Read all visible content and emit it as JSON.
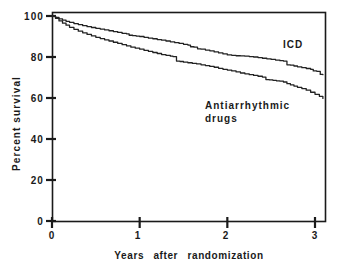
{
  "chart_data": {
    "type": "line",
    "title": "",
    "subtitle": "",
    "xlabel": "Years  after  randomization",
    "ylabel": "Percent  survival",
    "xlim": [
      0,
      3.1
    ],
    "ylim": [
      0,
      100
    ],
    "xticks": [
      0,
      1,
      2,
      3
    ],
    "xtick_labels": [
      "0",
      "1",
      "2",
      "3"
    ],
    "yticks": [
      0,
      20,
      40,
      60,
      80,
      100
    ],
    "ytick_labels": [
      "0",
      "20",
      "40",
      "60",
      "80",
      "100"
    ],
    "grid": false,
    "legend_position": "inline-annotations",
    "annotations": [
      {
        "text": "ICD",
        "x": 2.65,
        "y": 82
      },
      {
        "text": "Antiarrhythmic",
        "x": 1.75,
        "y": 57
      },
      {
        "text": "drugs",
        "x": 1.75,
        "y": 51
      }
    ],
    "series": [
      {
        "name": "ICD",
        "label": "ICD",
        "style": "step",
        "color": "#222222",
        "points": [
          [
            0.0,
            100.0
          ],
          [
            0.04,
            99.3
          ],
          [
            0.08,
            98.6
          ],
          [
            0.12,
            98.0
          ],
          [
            0.16,
            97.4
          ],
          [
            0.2,
            96.9
          ],
          [
            0.25,
            96.3
          ],
          [
            0.3,
            95.8
          ],
          [
            0.35,
            95.3
          ],
          [
            0.4,
            94.8
          ],
          [
            0.45,
            94.4
          ],
          [
            0.5,
            94.0
          ],
          [
            0.55,
            93.6
          ],
          [
            0.6,
            93.2
          ],
          [
            0.65,
            92.8
          ],
          [
            0.7,
            92.4
          ],
          [
            0.75,
            92.0
          ],
          [
            0.8,
            91.5
          ],
          [
            0.85,
            91.3
          ],
          [
            0.88,
            90.6
          ],
          [
            0.92,
            90.4
          ],
          [
            0.96,
            90.2
          ],
          [
            1.0,
            90.0
          ],
          [
            1.05,
            89.6
          ],
          [
            1.1,
            89.2
          ],
          [
            1.15,
            88.9
          ],
          [
            1.2,
            88.5
          ],
          [
            1.25,
            88.2
          ],
          [
            1.3,
            87.8
          ],
          [
            1.35,
            87.4
          ],
          [
            1.4,
            87.0
          ],
          [
            1.45,
            86.6
          ],
          [
            1.5,
            86.2
          ],
          [
            1.55,
            85.8
          ],
          [
            1.58,
            85.0
          ],
          [
            1.62,
            84.8
          ],
          [
            1.66,
            84.0
          ],
          [
            1.7,
            83.8
          ],
          [
            1.75,
            83.4
          ],
          [
            1.8,
            83.0
          ],
          [
            1.85,
            82.5
          ],
          [
            1.9,
            82.0
          ],
          [
            1.95,
            81.5
          ],
          [
            2.0,
            81.0
          ],
          [
            2.05,
            80.8
          ],
          [
            2.1,
            80.6
          ],
          [
            2.15,
            80.5
          ],
          [
            2.2,
            80.4
          ],
          [
            2.25,
            80.2
          ],
          [
            2.3,
            80.0
          ],
          [
            2.35,
            79.7
          ],
          [
            2.4,
            79.4
          ],
          [
            2.45,
            79.1
          ],
          [
            2.5,
            78.8
          ],
          [
            2.55,
            78.5
          ],
          [
            2.6,
            78.2
          ],
          [
            2.64,
            78.0
          ],
          [
            2.68,
            76.2
          ],
          [
            2.72,
            76.0
          ],
          [
            2.76,
            75.6
          ],
          [
            2.8,
            75.2
          ],
          [
            2.85,
            74.8
          ],
          [
            2.9,
            74.4
          ],
          [
            2.95,
            74.0
          ],
          [
            2.98,
            73.2
          ],
          [
            3.02,
            73.0
          ],
          [
            3.05,
            73.0
          ],
          [
            3.06,
            71.5
          ],
          [
            3.09,
            71.4
          ]
        ]
      },
      {
        "name": "Antiarrhythmic drugs",
        "label": "Antiarrhythmic drugs",
        "style": "step",
        "color": "#222222",
        "points": [
          [
            0.0,
            100.0
          ],
          [
            0.04,
            98.8
          ],
          [
            0.08,
            97.6
          ],
          [
            0.12,
            96.5
          ],
          [
            0.16,
            95.5
          ],
          [
            0.2,
            94.5
          ],
          [
            0.25,
            93.5
          ],
          [
            0.3,
            92.6
          ],
          [
            0.35,
            91.8
          ],
          [
            0.4,
            91.0
          ],
          [
            0.45,
            90.3
          ],
          [
            0.5,
            89.6
          ],
          [
            0.55,
            89.0
          ],
          [
            0.6,
            88.4
          ],
          [
            0.65,
            87.8
          ],
          [
            0.7,
            87.2
          ],
          [
            0.75,
            86.6
          ],
          [
            0.8,
            86.0
          ],
          [
            0.85,
            85.4
          ],
          [
            0.9,
            84.8
          ],
          [
            0.95,
            84.3
          ],
          [
            1.0,
            83.8
          ],
          [
            1.05,
            83.2
          ],
          [
            1.1,
            82.7
          ],
          [
            1.15,
            82.2
          ],
          [
            1.2,
            81.7
          ],
          [
            1.25,
            81.2
          ],
          [
            1.3,
            80.8
          ],
          [
            1.35,
            80.4
          ],
          [
            1.38,
            80.2
          ],
          [
            1.42,
            78.0
          ],
          [
            1.46,
            77.8
          ],
          [
            1.5,
            77.5
          ],
          [
            1.55,
            77.2
          ],
          [
            1.6,
            76.9
          ],
          [
            1.65,
            76.6
          ],
          [
            1.7,
            76.2
          ],
          [
            1.75,
            75.8
          ],
          [
            1.8,
            75.4
          ],
          [
            1.85,
            75.0
          ],
          [
            1.9,
            74.5
          ],
          [
            1.95,
            74.0
          ],
          [
            2.0,
            73.6
          ],
          [
            2.05,
            73.2
          ],
          [
            2.1,
            72.7
          ],
          [
            2.15,
            72.2
          ],
          [
            2.2,
            71.8
          ],
          [
            2.25,
            71.4
          ],
          [
            2.3,
            71.0
          ],
          [
            2.35,
            70.6
          ],
          [
            2.4,
            70.2
          ],
          [
            2.44,
            69.0
          ],
          [
            2.48,
            68.8
          ],
          [
            2.52,
            68.6
          ],
          [
            2.56,
            68.4
          ],
          [
            2.6,
            68.2
          ],
          [
            2.64,
            67.8
          ],
          [
            2.68,
            67.0
          ],
          [
            2.72,
            66.4
          ],
          [
            2.76,
            65.8
          ],
          [
            2.8,
            65.2
          ],
          [
            2.85,
            64.6
          ],
          [
            2.9,
            63.8
          ],
          [
            2.95,
            62.8
          ],
          [
            3.0,
            61.8
          ],
          [
            3.05,
            60.8
          ],
          [
            3.09,
            59.8
          ]
        ]
      }
    ]
  },
  "axes": {
    "frame_color": "#1a1a1a",
    "line_color": "#222222"
  }
}
